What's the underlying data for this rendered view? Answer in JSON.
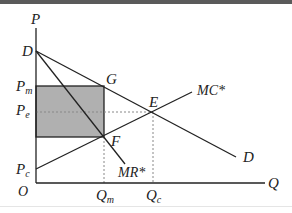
{
  "diagram": {
    "type": "economics-monopoly-welfare",
    "axes": {
      "y_label": "P",
      "x_label": "Q",
      "origin_label": "O"
    },
    "y_ticks": [
      {
        "label": "P",
        "sub": "m",
        "y": 86
      },
      {
        "label": "P",
        "sub": "e",
        "y": 112
      },
      {
        "label": "P",
        "sub": "c",
        "y": 169
      }
    ],
    "x_ticks": [
      {
        "label": "Q",
        "sub": "m",
        "x": 104
      },
      {
        "label": "Q",
        "sub": "c",
        "x": 153
      }
    ],
    "points": {
      "D": "D",
      "G": "G",
      "E": "E",
      "F": "F"
    },
    "curves": {
      "demand": "D",
      "mr": "MR*",
      "mc": "MC*"
    },
    "colors": {
      "shaded": "#b0b0b0",
      "line": "#222222",
      "dotted": "#888888"
    }
  }
}
